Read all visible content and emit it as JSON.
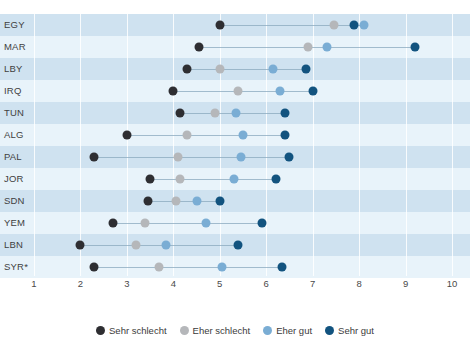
{
  "chart_data": {
    "type": "scatter",
    "title": "",
    "xlabel": "",
    "ylabel": "",
    "xlim": [
      1,
      10
    ],
    "xticks": [
      1,
      2,
      3,
      4,
      5,
      6,
      7,
      8,
      9,
      10
    ],
    "grid": true,
    "legend_position": "bottom",
    "categories": [
      "EGY",
      "MAR",
      "LBY",
      "IRQ",
      "TUN",
      "ALG",
      "PAL",
      "JOR",
      "SDN",
      "YEM",
      "LBN",
      "SYR*"
    ],
    "series": [
      {
        "name": "Sehr schlecht",
        "color": "#2e2e32",
        "values": [
          5.0,
          4.55,
          4.3,
          4.0,
          4.15,
          3.0,
          2.3,
          3.5,
          3.45,
          2.7,
          2.0,
          2.3
        ]
      },
      {
        "name": "Eher schlecht",
        "color": "#b5b7ba",
        "values": [
          7.45,
          6.9,
          5.0,
          5.4,
          4.9,
          4.3,
          4.1,
          4.15,
          4.05,
          3.4,
          3.2,
          3.7
        ]
      },
      {
        "name": "Eher gut",
        "color": "#7aadd4",
        "values": [
          8.1,
          7.3,
          6.15,
          6.3,
          5.35,
          5.5,
          5.45,
          5.3,
          4.5,
          4.7,
          3.85,
          5.05
        ]
      },
      {
        "name": "Sehr gut",
        "color": "#12537f",
        "values": [
          7.9,
          9.2,
          6.85,
          7.0,
          6.4,
          6.4,
          6.5,
          6.2,
          5.0,
          5.9,
          5.4,
          6.35
        ]
      }
    ]
  },
  "axis": {
    "tick_labels": [
      "1",
      "2",
      "3",
      "4",
      "5",
      "6",
      "7",
      "8",
      "9",
      "10"
    ]
  },
  "legend": {
    "items": [
      {
        "label": "Sehr schlecht",
        "color": "#2e2e32"
      },
      {
        "label": "Eher schlecht",
        "color": "#b5b7ba"
      },
      {
        "label": "Eher gut",
        "color": "#7aadd4"
      },
      {
        "label": "Sehr gut",
        "color": "#12537f"
      }
    ]
  },
  "colors": {
    "band_odd": "#cfe2f0",
    "band_even": "#e8f3fa",
    "gridline": "#ffffff",
    "connector": "#8aa8bd"
  }
}
